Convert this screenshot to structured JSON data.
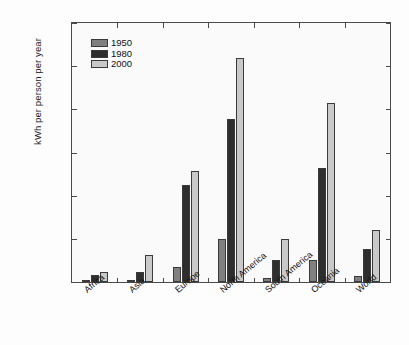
{
  "chart_data": {
    "type": "bar",
    "title": "",
    "subtitle": "",
    "xlabel": "",
    "ylabel": "kWh per person per year",
    "ylim": [
      0,
      12000
    ],
    "ytick_labels": [
      "0",
      "2,000",
      "4,000",
      "6,000",
      "8,000",
      "10,000",
      "12,000"
    ],
    "ytick_values": [
      0,
      2000,
      4000,
      6000,
      8000,
      10000,
      12000
    ],
    "grid": false,
    "legend_position": "top-left",
    "categories": [
      "Africa",
      "Asia",
      "Europe",
      "North America",
      "South America",
      "Oceania",
      "World"
    ],
    "series": [
      {
        "name": "1950",
        "color": "#808080",
        "values": [
          60,
          80,
          700,
          2000,
          200,
          1000,
          300
        ]
      },
      {
        "name": "1980",
        "color": "#2e2e2e",
        "values": [
          330,
          450,
          4500,
          7550,
          1000,
          5300,
          1550
        ]
      },
      {
        "name": "2000",
        "color": "#c9c9c9",
        "values": [
          480,
          1250,
          5150,
          10400,
          2000,
          8300,
          2400
        ]
      }
    ]
  }
}
